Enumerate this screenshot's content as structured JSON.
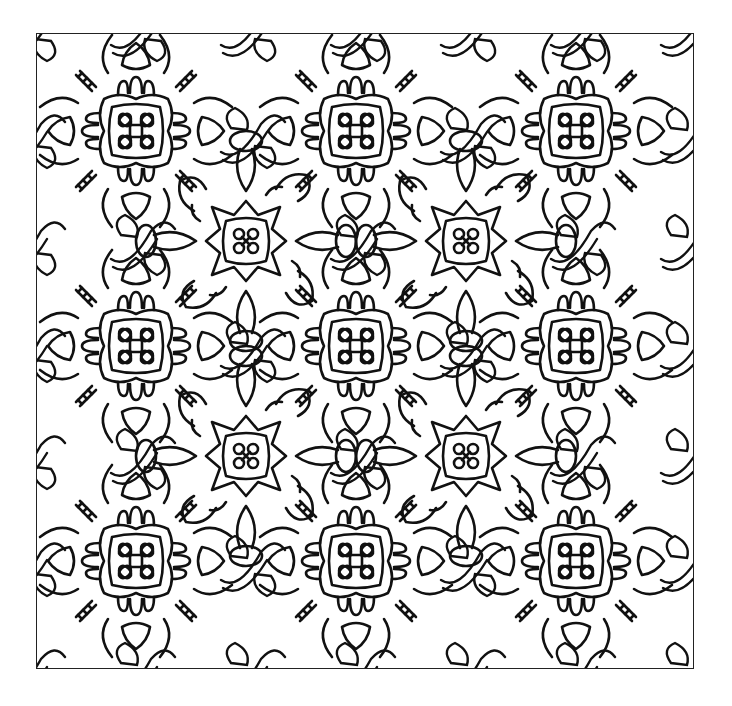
{
  "artwork": {
    "kind": "coloring-page-pattern",
    "line_color": "#111111",
    "background_color": "#ffffff",
    "border_color": "#222222",
    "motifs": [
      {
        "name": "flower-medallion",
        "centers": [
          [
            135,
            130
          ],
          [
            355,
            130
          ],
          [
            575,
            130
          ],
          [
            135,
            345
          ],
          [
            355,
            345
          ],
          [
            575,
            345
          ],
          [
            135,
            560
          ],
          [
            355,
            560
          ],
          [
            575,
            560
          ]
        ]
      },
      {
        "name": "star-medallion",
        "centers": [
          [
            245,
            240
          ],
          [
            465,
            240
          ],
          [
            245,
            455
          ],
          [
            465,
            455
          ]
        ]
      }
    ]
  }
}
